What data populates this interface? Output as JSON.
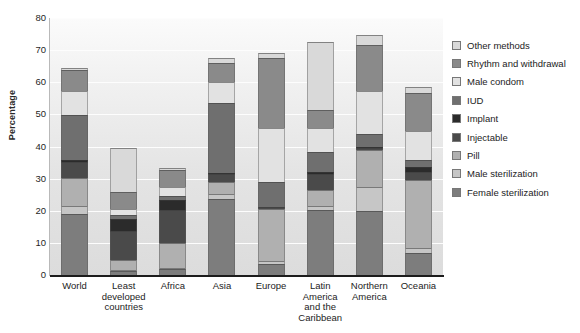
{
  "chart_data": {
    "type": "bar",
    "title": "",
    "xlabel": "",
    "ylabel": "Percentage",
    "ylim": [
      0,
      80
    ],
    "yticks": [
      0,
      10,
      20,
      30,
      40,
      50,
      60,
      70,
      80
    ],
    "grid": true,
    "stacked": true,
    "legend_position": "right",
    "categories": [
      "World",
      "Least developed countries",
      "Africa",
      "Asia",
      "Europe",
      "Latin America and the Caribbean",
      "Northern America",
      "Oceania"
    ],
    "category_lines": [
      [
        "World"
      ],
      [
        "Least",
        "developed",
        "countries"
      ],
      [
        "Africa"
      ],
      [
        "Asia"
      ],
      [
        "Europe"
      ],
      [
        "Latin",
        "America",
        "and the",
        "Caribbean"
      ],
      [
        "Northern",
        "America"
      ],
      [
        "Oceania"
      ]
    ],
    "series": [
      {
        "name": "Female sterilization",
        "color": "#7d7d7d",
        "values": [
          19.0,
          1.4,
          1.8,
          23.8,
          3.5,
          20.2,
          20.0,
          7.0
        ]
      },
      {
        "name": "Male sterilization",
        "color": "#c6c6c6",
        "values": [
          2.4,
          0.3,
          0.3,
          1.5,
          0.8,
          1.3,
          7.5,
          1.5
        ]
      },
      {
        "name": "Pill",
        "color": "#b0b0b0",
        "values": [
          8.8,
          3.0,
          7.9,
          3.6,
          16.2,
          4.9,
          11.5,
          21.0
        ]
      },
      {
        "name": "Injectable",
        "color": "#4a4a4a",
        "values": [
          4.9,
          9.0,
          10.2,
          2.7,
          0.6,
          5.2,
          0.6,
          2.6
        ]
      },
      {
        "name": "Implant",
        "color": "#2b2b2b",
        "values": [
          0.8,
          3.7,
          3.0,
          0.3,
          0.2,
          0.6,
          0.2,
          1.4
        ]
      },
      {
        "name": "IUD",
        "color": "#6f6f6f",
        "values": [
          13.9,
          1.3,
          1.5,
          21.6,
          7.8,
          6.1,
          4.2,
          2.2
        ]
      },
      {
        "name": "Male condom",
        "color": "#e2e2e2",
        "values": [
          7.6,
          2.0,
          2.8,
          6.6,
          16.6,
          7.4,
          13.3,
          9.1
        ]
      },
      {
        "name": "Rhythm and withdrawal",
        "color": "#8a8a8a",
        "values": [
          6.4,
          5.1,
          5.3,
          6.0,
          22.0,
          5.6,
          14.3,
          12.0
        ]
      },
      {
        "name": "Other methods",
        "color": "#d9d9d9",
        "values": [
          0.6,
          13.8,
          0.5,
          1.5,
          1.5,
          21.2,
          3.0,
          1.6
        ]
      }
    ],
    "totals": [
      64.4,
      39.6,
      33.3,
      67.6,
      69.2,
      72.5,
      74.6,
      58.4
    ]
  },
  "legend": {
    "items": [
      {
        "label": "Other methods",
        "swatch": "#d9d9d9"
      },
      {
        "label": "Rhythm and withdrawal",
        "swatch": "#8a8a8a"
      },
      {
        "label": "Male condom",
        "swatch": "#e2e2e2"
      },
      {
        "label": "IUD",
        "swatch": "#6f6f6f"
      },
      {
        "label": "Implant",
        "swatch": "#2b2b2b"
      },
      {
        "label": "Injectable",
        "swatch": "#4a4a4a"
      },
      {
        "label": "Pill",
        "swatch": "#b0b0b0"
      },
      {
        "label": "Male sterilization",
        "swatch": "#c6c6c6"
      },
      {
        "label": "Female sterilization",
        "swatch": "#7d7d7d"
      }
    ]
  }
}
